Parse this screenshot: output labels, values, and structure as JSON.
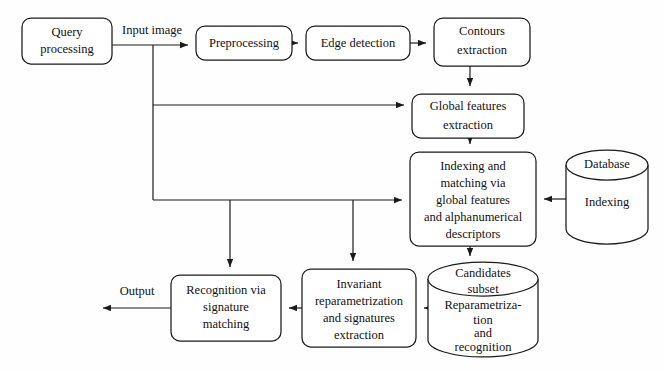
{
  "diagram": {
    "type": "flowchart",
    "colors": {
      "background": "#fefefe",
      "stroke": "#1a1a1a",
      "node_fill": "#ffffff",
      "text": "#111111"
    },
    "nodes": [
      {
        "id": "query-processing",
        "shape": "rounded-rect",
        "lines": [
          "Query",
          "processing"
        ],
        "x": 22,
        "y": 18,
        "w": 90,
        "h": 46
      },
      {
        "id": "preprocessing",
        "shape": "rounded-rect",
        "lines": [
          "Preprocessing"
        ],
        "x": 196,
        "y": 26,
        "w": 96,
        "h": 34
      },
      {
        "id": "edge-detection",
        "shape": "rounded-rect",
        "lines": [
          "Edge detection"
        ],
        "x": 306,
        "y": 26,
        "w": 104,
        "h": 34
      },
      {
        "id": "contours-extraction",
        "shape": "rounded-rect",
        "lines": [
          "Contours",
          "extraction"
        ],
        "x": 434,
        "y": 18,
        "w": 96,
        "h": 48
      },
      {
        "id": "global-features-extraction",
        "shape": "rounded-rect",
        "lines": [
          "Global features",
          "extraction"
        ],
        "x": 412,
        "y": 94,
        "w": 112,
        "h": 44
      },
      {
        "id": "indexing-matching",
        "shape": "rounded-rect",
        "lines": [
          "Indexing and",
          "matching via",
          "global features",
          "and alphanumerical",
          "descriptors"
        ],
        "x": 410,
        "y": 152,
        "w": 126,
        "h": 94
      },
      {
        "id": "database-indexing",
        "shape": "cylinder",
        "top_label": "Database",
        "body_label": "Indexing",
        "x": 566,
        "y": 150,
        "w": 82,
        "h": 94
      },
      {
        "id": "candidates-subset",
        "shape": "cylinder",
        "top_label_lines": [
          "Candidates",
          "subset"
        ],
        "body_label_lines": [
          "Reparametriza-",
          "tion",
          "and",
          "recognition"
        ],
        "x": 428,
        "y": 259,
        "w": 110,
        "h": 100
      },
      {
        "id": "invariant-reparametrization",
        "shape": "rounded-rect",
        "lines": [
          "Invariant",
          "reparametrization",
          "and signatures",
          "extraction"
        ],
        "x": 302,
        "y": 269,
        "w": 114,
        "h": 78
      },
      {
        "id": "recognition-signature-matching",
        "shape": "rounded-rect",
        "lines": [
          "Recognition via",
          "signature",
          "matching"
        ],
        "x": 171,
        "y": 275,
        "w": 110,
        "h": 66
      }
    ],
    "edge_labels": [
      {
        "id": "input-image-label",
        "text": "Input  image",
        "x": 152,
        "y": 31
      },
      {
        "id": "output-label",
        "text": "Output",
        "x": 137,
        "y": 292
      }
    ],
    "edges": [
      {
        "id": "query-to-preprocessing",
        "from": "query-processing",
        "to": "preprocessing"
      },
      {
        "id": "preprocessing-to-edge-detection",
        "from": "preprocessing",
        "to": "edge-detection"
      },
      {
        "id": "edge-detection-to-contours",
        "from": "edge-detection",
        "to": "contours-extraction"
      },
      {
        "id": "contours-to-global-features",
        "from": "contours-extraction",
        "to": "global-features-extraction"
      },
      {
        "id": "input-branch-to-global-features",
        "from": "query-processing",
        "to": "global-features-extraction"
      },
      {
        "id": "global-features-to-indexing",
        "from": "global-features-extraction",
        "to": "indexing-matching"
      },
      {
        "id": "input-branch-to-indexing",
        "from": "query-processing",
        "to": "indexing-matching"
      },
      {
        "id": "database-to-indexing",
        "from": "database-indexing",
        "to": "indexing-matching"
      },
      {
        "id": "indexing-to-candidates",
        "from": "indexing-matching",
        "to": "candidates-subset"
      },
      {
        "id": "candidates-to-invariant",
        "from": "candidates-subset",
        "to": "invariant-reparametrization"
      },
      {
        "id": "invariant-to-recognition",
        "from": "invariant-reparametrization",
        "to": "recognition-signature-matching"
      },
      {
        "id": "branch-to-invariant",
        "from": "query-processing",
        "to": "invariant-reparametrization"
      },
      {
        "id": "branch-to-recognition",
        "from": "query-processing",
        "to": "recognition-signature-matching"
      },
      {
        "id": "recognition-to-output",
        "from": "recognition-signature-matching",
        "to": "output"
      }
    ]
  }
}
